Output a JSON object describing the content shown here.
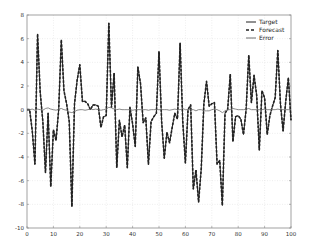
{
  "chart_data": {
    "type": "line",
    "title": "",
    "xlabel": "",
    "ylabel": "",
    "xlim": [
      0,
      100
    ],
    "ylim": [
      -10,
      8
    ],
    "xticks": [
      0,
      10,
      20,
      30,
      40,
      50,
      60,
      70,
      80,
      90,
      100
    ],
    "yticks": [
      -10,
      -8,
      -6,
      -4,
      -2,
      0,
      2,
      4,
      6,
      8
    ],
    "grid": true,
    "legend_position": "upper right",
    "x": [
      0,
      1,
      2,
      3,
      4,
      5,
      6,
      7,
      8,
      9,
      10,
      11,
      12,
      13,
      14,
      15,
      16,
      17,
      18,
      19,
      20,
      21,
      22,
      23,
      24,
      25,
      26,
      27,
      28,
      29,
      30,
      31,
      32,
      33,
      34,
      35,
      36,
      37,
      38,
      39,
      40,
      41,
      42,
      43,
      44,
      45,
      46,
      47,
      48,
      49,
      50,
      51,
      52,
      53,
      54,
      55,
      56,
      57,
      58,
      59,
      60,
      61,
      62,
      63,
      64,
      65,
      66,
      67,
      68,
      69,
      70,
      71,
      72,
      73,
      74,
      75,
      76,
      77,
      78,
      79,
      80,
      81,
      82,
      83,
      84,
      85,
      86,
      87,
      88,
      89,
      90,
      91,
      92,
      93,
      94,
      95,
      96,
      97,
      98,
      99,
      100
    ],
    "series": [
      {
        "name": "Target",
        "style": "solid",
        "color": "#222222",
        "values": [
          0,
          0,
          -1.8,
          -4.6,
          6.4,
          1.5,
          -1,
          -5.3,
          -0.3,
          -6.5,
          -1.7,
          -2.6,
          0,
          5.9,
          1.6,
          0.5,
          -1,
          -8.2,
          0.5,
          2.5,
          3.8,
          0.7,
          0.7,
          0.5,
          0,
          0.4,
          0.4,
          0.3,
          -1.5,
          -0.6,
          -0.5,
          7.3,
          0.2,
          3.1,
          -4.9,
          -0.9,
          -2.3,
          -1.3,
          -4.9,
          0.2,
          -1.2,
          -3.1,
          3.6,
          2.2,
          -1.1,
          -0.7,
          -4.6,
          -1,
          -0.6,
          -0.3,
          4.9,
          -1,
          -4.1,
          -1.9,
          -2.8,
          -1.5,
          -0.3,
          -0.8,
          5.6,
          -1,
          -4.5,
          0,
          0.4,
          -6.7,
          -5.1,
          -7.8,
          -5,
          0.5,
          2.4,
          0.3,
          0.5,
          0.6,
          -4.6,
          -4.3,
          -8.1,
          -0.3,
          0,
          3,
          -2.7,
          -0.6,
          -0.5,
          -0.8,
          -2.1,
          0,
          4.6,
          0.6,
          2.9,
          1.2,
          -3.4,
          1.6,
          1,
          -2.1,
          -0.5,
          0.3,
          1,
          5,
          0.5,
          -1.8,
          0.7,
          2.7,
          -0.9
        ]
      },
      {
        "name": "Forecast",
        "style": "dashed",
        "color": "#222222",
        "values": [
          0,
          0,
          -1.8,
          -4.6,
          6.4,
          1.5,
          -1,
          -5.3,
          -0.3,
          -6.5,
          -1.7,
          -2.6,
          0,
          5.9,
          1.6,
          0.5,
          -1,
          -8.2,
          0.5,
          2.5,
          3.8,
          0.7,
          0.7,
          0.5,
          0,
          0.4,
          0.4,
          0.3,
          -1.5,
          -0.6,
          -0.5,
          7.3,
          0.2,
          3.1,
          -4.9,
          -0.9,
          -2.3,
          -1.3,
          -4.9,
          0.2,
          -1.2,
          -3.1,
          3.6,
          2.2,
          -1.1,
          -0.7,
          -4.6,
          -1,
          -0.6,
          -0.3,
          4.9,
          -1,
          -4.1,
          -1.9,
          -2.8,
          -1.5,
          -0.3,
          -0.8,
          5.6,
          -1,
          -4.5,
          0,
          0.4,
          -6.7,
          -5.1,
          -7.8,
          -5,
          0.5,
          2.4,
          0.3,
          0.5,
          0.6,
          -4.6,
          -4.3,
          -8.1,
          -0.3,
          0,
          3,
          -2.7,
          -0.6,
          -0.5,
          -0.8,
          -2.1,
          0,
          4.6,
          0.6,
          2.9,
          1.2,
          -3.4,
          1.6,
          1,
          -2.1,
          -0.5,
          0.3,
          1,
          5,
          0.5,
          -1.8,
          0.7,
          2.7,
          -0.9
        ]
      },
      {
        "name": "Error",
        "style": "solid",
        "color": "#6e6e6e",
        "values": [
          0,
          0,
          0.05,
          -0.05,
          0.05,
          0,
          -0.05,
          0.1,
          0.15,
          0.05,
          0,
          -0.05,
          0.05,
          0.1,
          0,
          -0.05,
          -0.2,
          -0.25,
          -0.15,
          -0.05,
          0,
          0,
          -0.05,
          0,
          0.05,
          0,
          0.05,
          0,
          -0.05,
          0,
          0.05,
          0.2,
          0.15,
          0.05,
          0,
          0.05,
          0,
          0,
          0,
          0,
          -0.05,
          0,
          0,
          0,
          0,
          0,
          -0.05,
          0,
          0,
          0,
          0,
          0,
          0,
          0,
          -0.05,
          0,
          0.05,
          0,
          0,
          0.1,
          0,
          0,
          0,
          0,
          -0.1,
          0,
          0,
          -0.1,
          -0.1,
          -0.1,
          0,
          0.05,
          0,
          -0.1,
          -0.25,
          -0.1,
          0,
          0,
          0.1,
          0.05,
          0,
          0,
          0,
          0.05,
          0.1,
          0,
          0,
          0,
          0,
          0,
          0.05,
          0,
          0,
          0,
          0,
          0.05,
          0,
          0,
          0,
          0,
          0
        ]
      }
    ]
  },
  "axes": {
    "x_tick_labels": [
      "0",
      "10",
      "20",
      "30",
      "40",
      "50",
      "60",
      "70",
      "80",
      "90",
      "100"
    ],
    "y_tick_labels": [
      "8",
      "6",
      "4",
      "2",
      "0",
      "-2",
      "-4",
      "-6",
      "-8",
      "-10"
    ]
  },
  "legend": {
    "items": [
      {
        "label": "Target",
        "style": "solid"
      },
      {
        "label": "Forecast",
        "style": "dashed"
      },
      {
        "label": "Error",
        "style": "solid-gray"
      }
    ]
  }
}
